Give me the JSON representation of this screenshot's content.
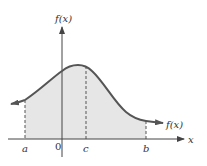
{
  "diagram": {
    "y_axis_label": "f(x)",
    "x_axis_label": "x",
    "curve_label": "f(x)",
    "ticks": {
      "a": "a",
      "zero": "0",
      "c": "c",
      "b": "b"
    },
    "colors": {
      "curve": "#555555",
      "fill": "#e6e6e6",
      "axis": "#444444",
      "dashed": "#555555"
    }
  }
}
